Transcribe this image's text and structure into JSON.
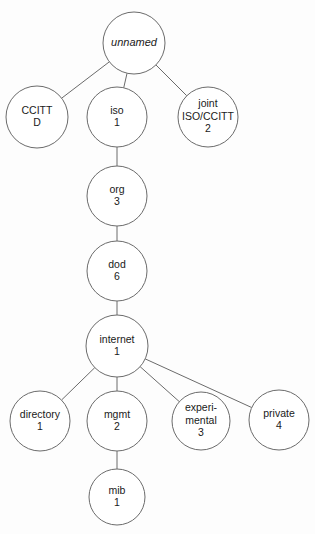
{
  "diagram": {
    "type": "tree",
    "background_color": "#fdfdfd",
    "stroke_color": "#6b6b6b",
    "text_color": "#1a1a1a",
    "nodes": [
      {
        "id": "unnamed",
        "label": "unnamed",
        "value": "",
        "italic": true,
        "cx": 134,
        "cy": 43,
        "r": 31
      },
      {
        "id": "ccitt",
        "label": "CCITT",
        "value": "D",
        "italic": false,
        "cx": 37,
        "cy": 117,
        "r": 31
      },
      {
        "id": "iso",
        "label": "iso",
        "value": "1",
        "italic": false,
        "cx": 117,
        "cy": 117,
        "r": 30
      },
      {
        "id": "joint",
        "label": "joint",
        "label2": "ISO/CCITT",
        "value": "2",
        "italic": false,
        "cx": 208,
        "cy": 117,
        "r": 30
      },
      {
        "id": "org",
        "label": "org",
        "value": "3",
        "italic": false,
        "cx": 117,
        "cy": 196,
        "r": 30
      },
      {
        "id": "dod",
        "label": "dod",
        "value": "6",
        "italic": false,
        "cx": 117,
        "cy": 271,
        "r": 30
      },
      {
        "id": "internet",
        "label": "internet",
        "value": "1",
        "italic": false,
        "cx": 117,
        "cy": 346,
        "r": 31
      },
      {
        "id": "directory",
        "label": "directory",
        "value": "1",
        "italic": false,
        "cx": 40,
        "cy": 421,
        "r": 30
      },
      {
        "id": "mgmt",
        "label": "mgmt",
        "value": "2",
        "italic": false,
        "cx": 117,
        "cy": 421,
        "r": 30
      },
      {
        "id": "experimental",
        "label": "experi-",
        "label2": "mental",
        "value": "3",
        "italic": false,
        "cx": 201,
        "cy": 421,
        "r": 29
      },
      {
        "id": "private",
        "label": "private",
        "value": "4",
        "italic": false,
        "cx": 279,
        "cy": 420,
        "r": 30
      },
      {
        "id": "mib",
        "label": "mib",
        "value": "1",
        "italic": false,
        "cx": 117,
        "cy": 497,
        "r": 28
      }
    ],
    "edges": [
      {
        "from": "unnamed",
        "to": "ccitt"
      },
      {
        "from": "unnamed",
        "to": "iso"
      },
      {
        "from": "unnamed",
        "to": "joint"
      },
      {
        "from": "iso",
        "to": "org"
      },
      {
        "from": "org",
        "to": "dod"
      },
      {
        "from": "dod",
        "to": "internet"
      },
      {
        "from": "internet",
        "to": "directory"
      },
      {
        "from": "internet",
        "to": "mgmt"
      },
      {
        "from": "internet",
        "to": "experimental"
      },
      {
        "from": "internet",
        "to": "private"
      },
      {
        "from": "mgmt",
        "to": "mib"
      }
    ]
  }
}
